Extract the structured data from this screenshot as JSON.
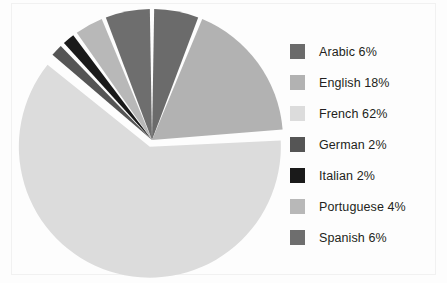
{
  "chart_data": {
    "type": "pie",
    "title": "",
    "legend_position": "right",
    "start_angle_deg": 0,
    "direction": "clockwise",
    "exploded_slice": "French",
    "categories": [
      "Arabic",
      "English",
      "French",
      "German",
      "Italian",
      "Portuguese",
      "Spanish"
    ],
    "values": [
      6,
      18,
      62,
      2,
      2,
      4,
      6
    ],
    "units": "percent",
    "colors": [
      "#6b6b6b",
      "#b2b2b2",
      "#dcdcdc",
      "#555555",
      "#1a1a1a",
      "#b8b8b8",
      "#6e6e6e"
    ],
    "slices": [
      {
        "label": "Arabic",
        "value": 6,
        "percent_text": "6%",
        "color": "#6b6b6b"
      },
      {
        "label": "English",
        "value": 18,
        "percent_text": "18%",
        "color": "#b2b2b2"
      },
      {
        "label": "French",
        "value": 62,
        "percent_text": "62%",
        "color": "#dcdcdc"
      },
      {
        "label": "German",
        "value": 2,
        "percent_text": "2%",
        "color": "#555555"
      },
      {
        "label": "Italian",
        "value": 2,
        "percent_text": "2%",
        "color": "#1a1a1a"
      },
      {
        "label": "Portuguese",
        "value": 4,
        "percent_text": "4%",
        "color": "#b8b8b8"
      },
      {
        "label": "Spanish",
        "value": 6,
        "percent_text": "6%",
        "color": "#6e6e6e"
      }
    ]
  },
  "legend": {
    "items": [
      {
        "label": "Arabic 6%",
        "color": "#6b6b6b"
      },
      {
        "label": "English 18%",
        "color": "#b2b2b2"
      },
      {
        "label": "French 62%",
        "color": "#dcdcdc"
      },
      {
        "label": "German 2%",
        "color": "#555555"
      },
      {
        "label": "Italian 2%",
        "color": "#1a1a1a"
      },
      {
        "label": "Portuguese 4%",
        "color": "#b8b8b8"
      },
      {
        "label": "Spanish 6%",
        "color": "#6e6e6e"
      }
    ]
  },
  "style": {
    "background": "#fdfdfd",
    "separator": "#ffffff",
    "border": "#f1f1f1",
    "text": "#231f20"
  }
}
